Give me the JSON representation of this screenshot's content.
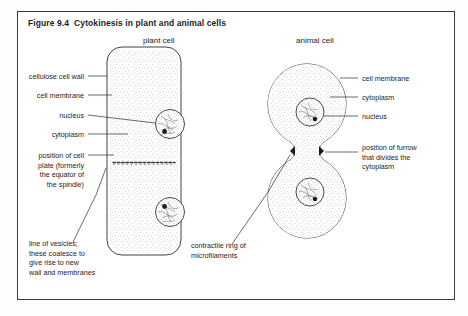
{
  "figure": {
    "title": "Figure 9.4  Cytokinesis in plant and animal cells",
    "headers": {
      "plant": "plant cell",
      "animal": "animal cell"
    }
  },
  "labels": {
    "plant": [
      {
        "id": "cellulose-cell-wall",
        "text": "cellulose cell wall"
      },
      {
        "id": "cell-membrane",
        "text": "cell membrane"
      },
      {
        "id": "nucleus",
        "text": "nucleus"
      },
      {
        "id": "cytoplasm",
        "text": "cytoplasm"
      },
      {
        "id": "cell-plate",
        "text": "position of cell\nplate (formerly\nthe equator of\nthe spindle)"
      },
      {
        "id": "line-of-vesicles",
        "text": "line of vesicles;\nthese coalesce to\ngive rise to new\nwall and membranes"
      }
    ],
    "animal": [
      {
        "id": "cell-membrane",
        "text": "cell membrane"
      },
      {
        "id": "cytoplasm",
        "text": "cytoplasm"
      },
      {
        "id": "nucleus",
        "text": "nucleus"
      },
      {
        "id": "furrow",
        "text": "position of furrow\nthat divides the\ncytoplasm"
      },
      {
        "id": "contractile-ring",
        "text": "contractile ring of\nmicrofilaments"
      }
    ]
  },
  "colors": {
    "frame": "#3a3a3a",
    "ink": "#1d1d1d",
    "leader": "#2b2b2b",
    "stipple": "#8a8a8a",
    "background": "#ffffff"
  }
}
